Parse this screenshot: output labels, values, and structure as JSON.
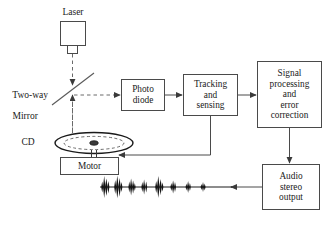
{
  "diagram": {
    "type": "block-diagram",
    "stroke_color": "#4a4a4a",
    "text_color": "#1a1a1a",
    "background": "#ffffff",
    "labels": {
      "laser": "Laser",
      "two_way_mirror": "Two-way\nMirror",
      "two_way_mirror_line1": "Two-way",
      "two_way_mirror_line2": "Mirror",
      "cd": "CD"
    },
    "blocks": [
      {
        "id": "photo-diode",
        "lines": [
          "Photo",
          "diode"
        ]
      },
      {
        "id": "tracking-and-sensing",
        "lines": [
          "Tracking",
          "and",
          "sensing"
        ]
      },
      {
        "id": "signal-processing",
        "lines": [
          "Signal",
          "processing",
          "and",
          "error",
          "correction"
        ]
      },
      {
        "id": "audio-stereo-output",
        "lines": [
          "Audio",
          "stereo",
          "output"
        ]
      },
      {
        "id": "motor",
        "lines": [
          "Motor"
        ]
      }
    ],
    "block_text": {
      "photo_diode_l1": "Photo",
      "photo_diode_l2": "diode",
      "tracking_l1": "Tracking",
      "tracking_l2": "and",
      "tracking_l3": "sensing",
      "signal_l1": "Signal",
      "signal_l2": "processing",
      "signal_l3": "and",
      "signal_l4": "error",
      "signal_l5": "correction",
      "audio_l1": "Audio",
      "audio_l2": "stereo",
      "audio_l3": "output",
      "motor_l1": "Motor"
    },
    "connections": [
      {
        "from": "laser",
        "to": "two-way-mirror",
        "style": "dashed",
        "direction": "down"
      },
      {
        "from": "two-way-mirror",
        "to": "cd",
        "style": "dashed",
        "direction": "down"
      },
      {
        "from": "cd",
        "to": "two-way-mirror",
        "style": "dashed",
        "direction": "up"
      },
      {
        "from": "two-way-mirror",
        "to": "photo-diode",
        "style": "dashed",
        "direction": "right"
      },
      {
        "from": "photo-diode",
        "to": "tracking-and-sensing",
        "style": "solid",
        "direction": "right"
      },
      {
        "from": "tracking-and-sensing",
        "to": "signal-processing",
        "style": "solid",
        "direction": "right"
      },
      {
        "from": "tracking-and-sensing",
        "to": "motor",
        "style": "solid",
        "direction": "down-left"
      },
      {
        "from": "signal-processing",
        "to": "audio-stereo-output",
        "style": "solid",
        "direction": "down"
      },
      {
        "from": "audio-stereo-output",
        "to": "waveform",
        "style": "solid",
        "direction": "left"
      }
    ],
    "waveform": {
      "name": "audio-waveform",
      "burst_count": 8,
      "amplitudes": [
        11,
        12,
        9,
        8,
        11,
        7,
        6,
        5
      ]
    }
  }
}
